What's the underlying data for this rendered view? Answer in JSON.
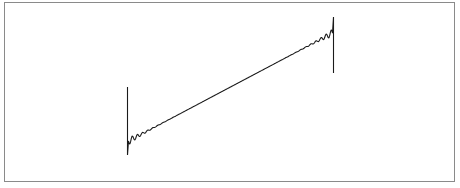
{
  "chart_data": {
    "type": "line",
    "title": "",
    "xlabel": "",
    "ylabel": "",
    "grid": false,
    "legend": [],
    "line_color": "#1a1a1a",
    "frame_color": "#8a8a8a",
    "x_range": [
      0,
      1
    ],
    "y_range": [
      -1,
      1
    ],
    "endpoints": {
      "start": {
        "x": 0,
        "y": -0.8,
        "jump_top": 1.0,
        "jump_bottom": -1.05
      },
      "end": {
        "x": 1,
        "y": 0.8,
        "jump_top": 1.05,
        "jump_bottom": -0.6
      }
    },
    "ripple": {
      "harmonics": 40,
      "amplitude_near_edges": 0.09
    }
  }
}
